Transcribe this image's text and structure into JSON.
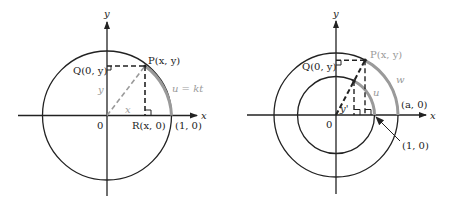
{
  "left_figure": {
    "axis_x_label": "x",
    "axis_y_label": "y",
    "origin_label": "0",
    "point_P": "P(x, y)",
    "point_Q": "Q(0, y)",
    "point_R": "R(x, 0)",
    "point_unit": "(1, 0)",
    "arc_label": "u = kt",
    "leg_x_label": "x",
    "leg_y_label": "y",
    "colors": {
      "line": "#222222",
      "arc": "#9a9a9a",
      "dashed_hyp": "#9a9a9a"
    }
  },
  "right_figure": {
    "axis_x_label": "x",
    "axis_y_label": "y",
    "origin_label": "0",
    "point_P": "P(x, y)",
    "point_Q": "Q(0, y)",
    "point_a": "(a, 0)",
    "point_unit": "(1, 0)",
    "outer_arc_label": "w",
    "inner_arc_label": "u",
    "leg_label": "y'",
    "colors": {
      "line": "#222222",
      "arc": "#9a9a9a"
    }
  }
}
